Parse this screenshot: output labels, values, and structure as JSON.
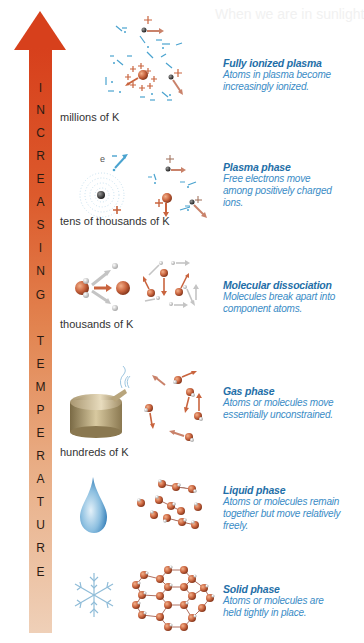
{
  "axis": {
    "label_letters": [
      "I",
      "N",
      "C",
      "R",
      "E",
      "A",
      "S",
      "I",
      "N",
      "G",
      "",
      "T",
      "E",
      "M",
      "P",
      "E",
      "R",
      "A",
      "T",
      "U",
      "R",
      "E"
    ],
    "label": "INCREASING TEMPERATURE",
    "colors": {
      "top": "#d7401c",
      "bottom": "#efd0b8"
    }
  },
  "phases": [
    {
      "id": "fully-ionized-plasma",
      "title": "Fully ionized plasma",
      "description": "Atoms in plasma become increasingly ionized.",
      "temperature": "millions of K",
      "illustration": "plasma-ions-icon"
    },
    {
      "id": "plasma-phase",
      "title": "Plasma phase",
      "description": "Free electrons move among positively charged ions.",
      "temperature": "tens of thousands of K",
      "illustration": "atom-ionization-icon",
      "electron_label": "e"
    },
    {
      "id": "molecular-dissociation",
      "title": "Molecular dissociation",
      "description": "Molecules break apart into component atoms.",
      "temperature": "thousands of K",
      "illustration": "molecule-splitting-icon"
    },
    {
      "id": "gas-phase",
      "title": "Gas phase",
      "description": "Atoms or molecules move essentially unconstrained.",
      "temperature": "hundreds of K",
      "illustration": "steaming-pot-icon"
    },
    {
      "id": "liquid-phase",
      "title": "Liquid phase",
      "description": "Atoms or molecules remain together but move relatively freely.",
      "temperature": "",
      "illustration": "water-drop-icon"
    },
    {
      "id": "solid-phase",
      "title": "Solid phase",
      "description": "Atoms or molecules are held tightly in place.",
      "temperature": "",
      "illustration": "snowflake-icon"
    }
  ],
  "colors": {
    "title": "#1f6fa8",
    "description": "#3a8cc6",
    "ion": "#c9643e",
    "electron": "#4aa3cf"
  }
}
